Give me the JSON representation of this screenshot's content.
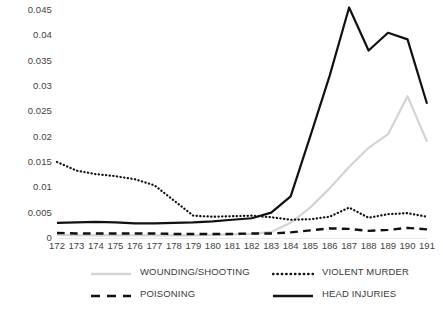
{
  "chart_data": {
    "type": "line",
    "title": "",
    "subtitle": "",
    "xlabel": "",
    "ylabel": "",
    "grid": false,
    "legend_position": "bottom",
    "categories": [
      "172",
      "173",
      "174",
      "175",
      "176",
      "177",
      "178",
      "179",
      "180",
      "181",
      "182",
      "183",
      "184",
      "185",
      "186",
      "187",
      "188",
      "189",
      "190",
      "191"
    ],
    "x": [
      "172",
      "173",
      "174",
      "175",
      "176",
      "177",
      "178",
      "179",
      "180",
      "181",
      "182",
      "183",
      "184",
      "185",
      "186",
      "187",
      "188",
      "189",
      "190",
      "191"
    ],
    "ylim": [
      0,
      0.045
    ],
    "ytick_labels": [
      "0.045",
      "0.04",
      "0.035",
      "0.03",
      "0.025",
      "0.02",
      "0.015",
      "0.01",
      "0.005",
      "0"
    ],
    "yticks": [
      0.045,
      0.04,
      0.035,
      0.03,
      0.025,
      0.02,
      0.015,
      0.01,
      0.005,
      0
    ],
    "series": [
      {
        "name": "WOUNDING/SHOOTING",
        "style": "solid",
        "color": "#d4d4d4",
        "width": 2.2,
        "values": [
          0.0006,
          0.0005,
          0.0005,
          0.0005,
          0.0005,
          0.0005,
          0.0005,
          0.0005,
          0.0006,
          0.0007,
          0.0008,
          0.0012,
          0.003,
          0.006,
          0.0098,
          0.014,
          0.0178,
          0.0205,
          0.028,
          0.019
        ]
      },
      {
        "name": "VIOLENT MURDER",
        "style": "dotted",
        "color": "#111111",
        "width": 2.2,
        "values": [
          0.015,
          0.0133,
          0.0126,
          0.0122,
          0.0116,
          0.0104,
          0.0074,
          0.0044,
          0.0042,
          0.0043,
          0.0044,
          0.0041,
          0.0036,
          0.0037,
          0.0042,
          0.006,
          0.004,
          0.0047,
          0.0049,
          0.0042
        ]
      },
      {
        "name": "POISONING",
        "style": "dashed",
        "color": "#111111",
        "width": 2.4,
        "values": [
          0.001,
          0.0009,
          0.0009,
          0.0009,
          0.0009,
          0.0009,
          0.0008,
          0.0008,
          0.0008,
          0.0008,
          0.0009,
          0.0009,
          0.0011,
          0.0015,
          0.0019,
          0.0018,
          0.0014,
          0.0016,
          0.002,
          0.0017
        ]
      },
      {
        "name": "HEAD INJURIES",
        "style": "solid",
        "color": "#111111",
        "width": 2.2,
        "values": [
          0.003,
          0.0031,
          0.0032,
          0.0031,
          0.0029,
          0.0029,
          0.003,
          0.0031,
          0.0033,
          0.0036,
          0.0039,
          0.005,
          0.0082,
          0.02,
          0.032,
          0.0455,
          0.037,
          0.0405,
          0.0392,
          0.0265
        ]
      }
    ]
  },
  "legend": {
    "items": [
      {
        "label": "WOUNDING/SHOOTING",
        "style": "solid",
        "color": "#d4d4d4"
      },
      {
        "label": "VIOLENT MURDER",
        "style": "dotted",
        "color": "#111111"
      },
      {
        "label": "POISONING",
        "style": "dashed",
        "color": "#111111"
      },
      {
        "label": "HEAD INJURIES",
        "style": "solid",
        "color": "#111111"
      }
    ]
  }
}
